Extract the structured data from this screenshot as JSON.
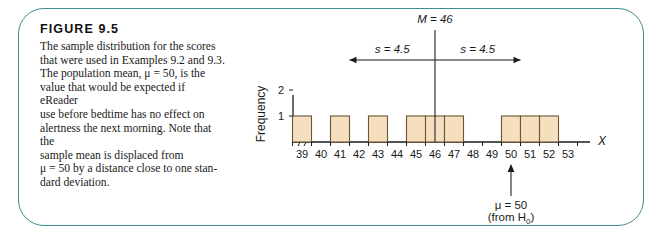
{
  "figure": {
    "title": "FIGURE 9.5",
    "caption_lines": [
      "The sample distribution for the scores",
      "that were used in Examples 9.2 and 9.3.",
      "The population mean, μ = 50, is the",
      "value that would be expected if eReader",
      "use before bedtime has no effect on",
      "alertness the next morning. Note that the",
      "sample mean is displaced from",
      "μ = 50 by a distance close to one stan-",
      "dard deviation."
    ],
    "frame_color": "#3f8f8c"
  },
  "chart_data": {
    "type": "bar",
    "title": "",
    "xlabel": "X",
    "ylabel": "Frequency",
    "categories": [
      39,
      40,
      41,
      42,
      43,
      44,
      45,
      46,
      47,
      48,
      49,
      50,
      51,
      52,
      53
    ],
    "values": [
      1,
      0,
      1,
      0,
      1,
      0,
      1,
      1,
      1,
      0,
      0,
      1,
      1,
      1,
      0
    ],
    "xtick_labels": [
      "39",
      "40",
      "41",
      "42",
      "43",
      "44",
      "45",
      "46",
      "47",
      "48",
      "49",
      "50",
      "51",
      "52",
      "53"
    ],
    "ytick_labels": [
      "1",
      "2"
    ],
    "ytick_values": [
      1,
      2
    ],
    "ylim": [
      0,
      2.6
    ],
    "xlim": [
      38.5,
      53.5
    ],
    "grid": false,
    "legend": null,
    "bar_fill": "#f6dfbf",
    "bar_stroke": "#6b5433",
    "axis_break": true,
    "annotations": {
      "mean_label": "M = 46",
      "mean_label_italic_part": "M",
      "mean_value": 46,
      "sd_left_label": "s = 4.5",
      "sd_right_label": "s = 4.5",
      "sd_value": 4.5,
      "sd_span_left": 41.5,
      "sd_span_right": 50.5,
      "mu_label": "μ = 50",
      "mu_source_label": "(from H",
      "mu_source_sub": "0",
      "mu_source_close": ")",
      "mu_value": 50
    }
  }
}
